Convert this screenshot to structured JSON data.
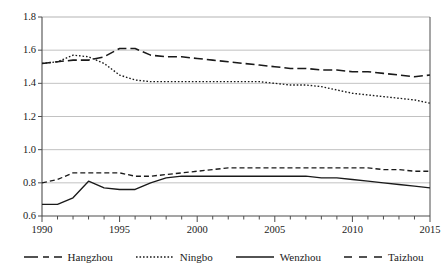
{
  "chart_data": {
    "type": "line",
    "title": "",
    "subtitle": "",
    "xlabel": "",
    "ylabel": "",
    "xlim": [
      1990,
      2015
    ],
    "ylim": [
      0.6,
      1.8
    ],
    "grid": "horizontal",
    "legend_position": "bottom",
    "x": [
      1990,
      1991,
      1992,
      1993,
      1994,
      1995,
      1996,
      1997,
      1998,
      1999,
      2000,
      2001,
      2002,
      2003,
      2004,
      2005,
      2006,
      2007,
      2008,
      2009,
      2010,
      2011,
      2012,
      2013,
      2014,
      2015
    ],
    "y_ticks": [
      0.6,
      0.8,
      1.0,
      1.2,
      1.4,
      1.6,
      1.8
    ],
    "y_tick_labels": [
      "0.6",
      "0.8",
      "1.0",
      "1.2",
      "1.4",
      "1.6",
      "1.8"
    ],
    "x_ticks": [
      1990,
      1995,
      2000,
      2005,
      2010,
      2015
    ],
    "x_tick_labels": [
      "1990",
      "1995",
      "2000",
      "2005",
      "2010",
      "2015"
    ],
    "series": [
      {
        "name": "Hangzhou",
        "style": "dash-dash",
        "values": [
          0.8,
          0.82,
          0.86,
          0.86,
          0.86,
          0.86,
          0.84,
          0.84,
          0.85,
          0.86,
          0.87,
          0.88,
          0.89,
          0.89,
          0.89,
          0.89,
          0.89,
          0.89,
          0.89,
          0.89,
          0.89,
          0.89,
          0.88,
          0.88,
          0.87,
          0.87
        ]
      },
      {
        "name": "Ningbo",
        "style": "dotted",
        "values": [
          1.52,
          1.53,
          1.57,
          1.56,
          1.52,
          1.45,
          1.42,
          1.41,
          1.41,
          1.41,
          1.41,
          1.41,
          1.41,
          1.41,
          1.41,
          1.4,
          1.39,
          1.39,
          1.38,
          1.36,
          1.34,
          1.33,
          1.32,
          1.31,
          1.3,
          1.28
        ]
      },
      {
        "name": "Wenzhou",
        "style": "solid",
        "values": [
          0.67,
          0.67,
          0.71,
          0.81,
          0.77,
          0.76,
          0.76,
          0.8,
          0.83,
          0.84,
          0.84,
          0.84,
          0.84,
          0.84,
          0.84,
          0.84,
          0.84,
          0.84,
          0.83,
          0.83,
          0.82,
          0.81,
          0.8,
          0.79,
          0.78,
          0.77
        ]
      },
      {
        "name": "Taizhou",
        "style": "long-dash",
        "values": [
          1.52,
          1.53,
          1.54,
          1.54,
          1.56,
          1.61,
          1.61,
          1.57,
          1.56,
          1.56,
          1.55,
          1.54,
          1.53,
          1.52,
          1.51,
          1.5,
          1.49,
          1.49,
          1.48,
          1.48,
          1.47,
          1.47,
          1.46,
          1.45,
          1.44,
          1.45
        ]
      }
    ]
  },
  "legend": {
    "items": [
      {
        "label": "Hangzhou"
      },
      {
        "label": "Ningbo"
      },
      {
        "label": "Wenzhou"
      },
      {
        "label": "Taizhou"
      }
    ]
  },
  "colors": {
    "line": "#1a1a1a",
    "grid": "#b3b3b3",
    "axis": "#4d4d4d",
    "background": "#ffffff"
  }
}
